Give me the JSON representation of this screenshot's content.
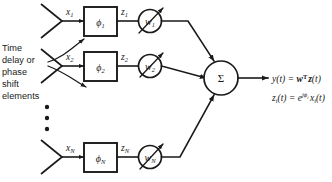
{
  "figure": {
    "background_color": "#ffffff",
    "line_color": "#1a1a1a"
  },
  "annotation": {
    "name": "time-delay-phase-shift-caption",
    "lines": [
      "Time",
      "delay or",
      "phase",
      "shift",
      "elements"
    ],
    "full_text": "Time delay or phase shift elements"
  },
  "channels": [
    {
      "index": 1,
      "antenna_name": "antenna-element-1",
      "input_label": "x",
      "input_subscript": "1",
      "phase_box_label": "ϕ",
      "phase_box_subscript": "1",
      "intermediate_label": "z",
      "intermediate_subscript": "1",
      "weight_label": "w",
      "weight_subscript": "1"
    },
    {
      "index": 2,
      "antenna_name": "antenna-element-2",
      "input_label": "x",
      "input_subscript": "2",
      "phase_box_label": "ϕ",
      "phase_box_subscript": "2",
      "intermediate_label": "z",
      "intermediate_subscript": "2",
      "weight_label": "w",
      "weight_subscript": "2"
    },
    {
      "index": 3,
      "antenna_name": "antenna-element-n",
      "input_label": "x",
      "input_subscript": "N",
      "phase_box_label": "ϕ",
      "phase_box_subscript": "N",
      "intermediate_label": "z",
      "intermediate_subscript": "N",
      "weight_label": "w",
      "weight_subscript": "N"
    }
  ],
  "ellipsis": {
    "name": "vertical-ellipsis",
    "dot_count": 3,
    "glyph": "•"
  },
  "summation": {
    "name": "summation-node",
    "symbol": "Σ"
  },
  "equations": [
    {
      "name": "output-equation",
      "text": "y(t) = w^T z(t)",
      "parts": {
        "lhs_var": "y",
        "lhs_arg": "(t)",
        "equals": "=",
        "weight_vector": "w",
        "transpose": "T",
        "signal_vector": "z",
        "rhs_arg": "(t)"
      }
    },
    {
      "name": "channel-equation",
      "text": "z_i(t) = e^{jϕ_i} x_i(t)",
      "parts": {
        "lhs_var": "z",
        "lhs_sub": "i",
        "lhs_arg": "(t)",
        "equals": "=",
        "exp_base": "e",
        "exp_j": "j",
        "exp_phi": "ϕ",
        "exp_phi_sub": "i",
        "rhs_var": "x",
        "rhs_sub": "i",
        "rhs_arg": "(t)"
      }
    }
  ]
}
